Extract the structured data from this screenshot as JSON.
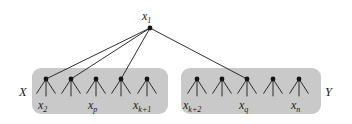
{
  "figure": {
    "type": "tree-diagram",
    "background_color": "#ffffff",
    "group_fill_color": "#c9c9c9",
    "node_color": "#141414",
    "edge_color": "#1a1a1a",
    "root": {
      "id": "x1",
      "label_base": "x",
      "label_sub": "1",
      "x": 150,
      "y": 28
    },
    "groups": [
      {
        "id": "X",
        "label": "X",
        "label_x": 19,
        "label_y": 86,
        "box": {
          "x": 32,
          "y": 68,
          "width": 136,
          "height": 46,
          "radius": 9
        },
        "nodes": [
          {
            "id": "x2",
            "label_base": "x",
            "label_sub": "2",
            "x": 46,
            "y": 79,
            "show_label": true,
            "label_x": 38,
            "label_y": 99,
            "linked_from_root": true
          },
          {
            "id": "n2",
            "label_base": "",
            "label_sub": "",
            "x": 71,
            "y": 79,
            "show_label": false,
            "linked_from_root": true
          },
          {
            "id": "xp",
            "label_base": "x",
            "label_sub": "p",
            "x": 96,
            "y": 79,
            "show_label": true,
            "label_x": 88,
            "label_y": 99,
            "linked_from_root": false
          },
          {
            "id": "n4",
            "label_base": "",
            "label_sub": "",
            "x": 121,
            "y": 79,
            "show_label": false,
            "linked_from_root": true
          },
          {
            "id": "xk1",
            "label_base": "x",
            "label_sub": "k+1",
            "x": 147,
            "y": 79,
            "show_label": true,
            "label_x": 133,
            "label_y": 99,
            "linked_from_root": false
          }
        ]
      },
      {
        "id": "Y",
        "label": "Y",
        "label_x": 325,
        "label_y": 86,
        "box": {
          "x": 181,
          "y": 68,
          "width": 140,
          "height": 46,
          "radius": 9
        },
        "nodes": [
          {
            "id": "xk2",
            "label_base": "x",
            "label_sub": "k+2",
            "x": 197,
            "y": 79,
            "show_label": true,
            "label_x": 183,
            "label_y": 99,
            "linked_from_root": false
          },
          {
            "id": "m2",
            "label_base": "",
            "label_sub": "",
            "x": 222,
            "y": 79,
            "show_label": false,
            "linked_from_root": false
          },
          {
            "id": "xq",
            "label_base": "x",
            "label_sub": "q",
            "x": 247,
            "y": 79,
            "show_label": true,
            "label_x": 239,
            "label_y": 99,
            "linked_from_root": true
          },
          {
            "id": "m4",
            "label_base": "",
            "label_sub": "",
            "x": 273,
            "y": 79,
            "show_label": false,
            "linked_from_root": false
          },
          {
            "id": "xn",
            "label_base": "x",
            "label_sub": "n",
            "x": 299,
            "y": 79,
            "show_label": true,
            "label_x": 291,
            "label_y": 99,
            "linked_from_root": false
          }
        ]
      }
    ],
    "leaf_fan": {
      "count": 3,
      "length": 17,
      "spread_degrees": 33,
      "stroke_width": 0.9
    },
    "root_edges_stroke_width": 0.9,
    "node_radius": 2.4
  }
}
